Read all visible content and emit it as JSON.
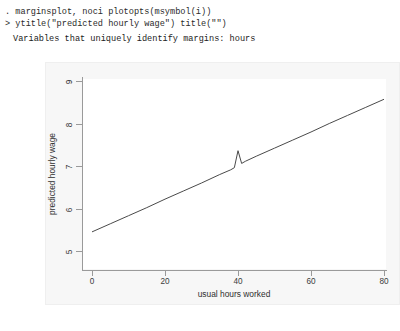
{
  "console": {
    "line1": ". marginsplot, noci plotopts(msymbol(i))",
    "line2": "> ytitle(\"predicted hourly wage\") title(\"\")",
    "line3": "Variables that uniquely identify margins: hours"
  },
  "graph": {
    "title": "",
    "region_color": "#f7f7f7",
    "plot_color": "#ffffff",
    "line_color": "#4a4a4a",
    "axis_color": "#9a9a9a"
  },
  "chart_data": {
    "type": "line",
    "title": "",
    "xlabel": "usual hours worked",
    "ylabel": "predicted hourly wage",
    "xlim": [
      -2.6,
      83.0
    ],
    "ylim": [
      4.72,
      9.28
    ],
    "xticks": [
      0,
      20,
      40,
      60,
      80
    ],
    "yticks": [
      5,
      6,
      7,
      8,
      9
    ],
    "grid": false,
    "legend": "none",
    "series": [
      {
        "name": "Predicted hourly wage",
        "x": [
          0,
          5,
          10,
          15,
          20,
          25,
          30,
          35,
          38,
          39,
          40,
          41,
          42,
          45,
          50,
          55,
          60,
          65,
          70,
          75,
          80
        ],
        "y": [
          5.45,
          5.64,
          5.83,
          6.02,
          6.22,
          6.41,
          6.6,
          6.8,
          6.91,
          6.96,
          7.36,
          7.06,
          7.11,
          7.23,
          7.42,
          7.61,
          7.8,
          8.0,
          8.19,
          8.38,
          8.57
        ]
      }
    ],
    "annotations": [
      {
        "label": "spike at full-time hours",
        "x": 40,
        "y": 7.36
      }
    ]
  }
}
